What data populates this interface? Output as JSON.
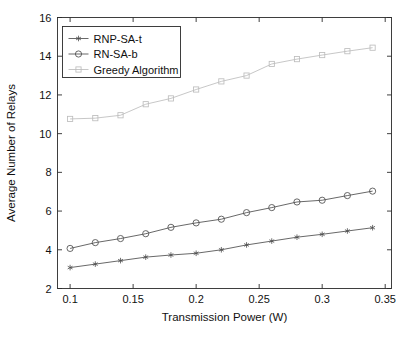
{
  "chart_data": {
    "type": "line",
    "title": "",
    "xlabel": "Transmission Power (W)",
    "ylabel": "Average Number of Relays",
    "xlim": [
      0.09,
      0.355
    ],
    "ylim": [
      2,
      16
    ],
    "xticks": [
      0.1,
      0.15,
      0.2,
      0.25,
      0.3,
      0.35
    ],
    "xtick_labels": [
      "0.1",
      "0.15",
      "0.2",
      "0.25",
      "0.3",
      "0.35"
    ],
    "yticks": [
      2,
      4,
      6,
      8,
      10,
      12,
      14,
      16
    ],
    "ytick_labels": [
      "2",
      "4",
      "6",
      "8",
      "10",
      "12",
      "14",
      "16"
    ],
    "grid": false,
    "legend_position": "upper-left",
    "x": [
      0.1,
      0.12,
      0.14,
      0.16,
      0.18,
      0.2,
      0.22,
      0.24,
      0.26,
      0.28,
      0.3,
      0.32,
      0.34
    ],
    "series": [
      {
        "name": "RNP-SA-t",
        "marker": "star",
        "color": "#4d4d4d",
        "values": [
          3.08,
          3.26,
          3.44,
          3.62,
          3.73,
          3.82,
          4.0,
          4.25,
          4.45,
          4.65,
          4.8,
          4.97,
          5.14
        ]
      },
      {
        "name": "RN-SA-b",
        "marker": "circle",
        "color": "#4d4d4d",
        "values": [
          4.07,
          4.37,
          4.58,
          4.83,
          5.16,
          5.39,
          5.58,
          5.92,
          6.18,
          6.47,
          6.56,
          6.8,
          7.03
        ]
      },
      {
        "name": "Greedy Algorithm",
        "marker": "square",
        "color": "#bdbdbd",
        "values": [
          10.76,
          10.8,
          10.95,
          11.52,
          11.82,
          12.28,
          12.7,
          13.0,
          13.6,
          13.85,
          14.06,
          14.26,
          14.44
        ]
      }
    ]
  },
  "legend": {
    "entries": [
      {
        "label": "RNP-SA-t"
      },
      {
        "label": "RN-SA-b"
      },
      {
        "label": "Greedy Algorithm"
      }
    ]
  }
}
